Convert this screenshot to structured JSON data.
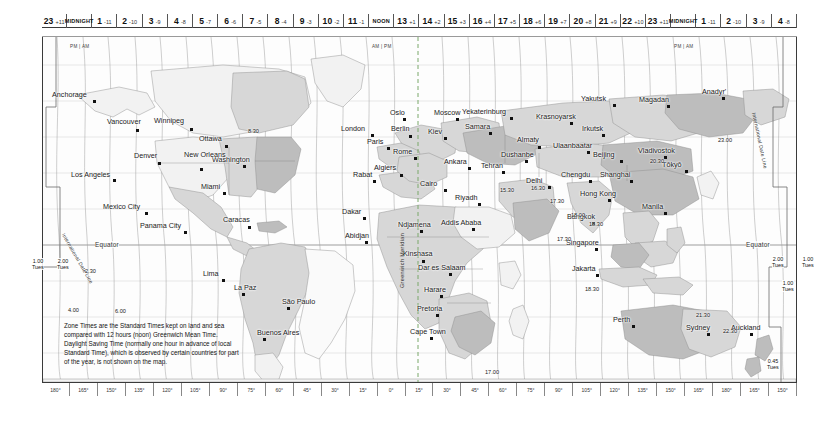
{
  "hour_axis": {
    "label": "Zone standard time across the map",
    "cells": [
      {
        "hour": "23",
        "offset": "+11",
        "sub": ""
      },
      {
        "hour": "MIDNIGHT",
        "offset": "",
        "sub": "PM | AM",
        "midnight": true
      },
      {
        "hour": "1",
        "offset": "-11",
        "sub": ""
      },
      {
        "hour": "2",
        "offset": "-10",
        "sub": ""
      },
      {
        "hour": "3",
        "offset": "-9",
        "sub": ""
      },
      {
        "hour": "4",
        "offset": "-8",
        "sub": ""
      },
      {
        "hour": "5",
        "offset": "-7",
        "sub": ""
      },
      {
        "hour": "6",
        "offset": "-6",
        "sub": ""
      },
      {
        "hour": "7",
        "offset": "-5",
        "sub": ""
      },
      {
        "hour": "8",
        "offset": "-4",
        "sub": ""
      },
      {
        "hour": "9",
        "offset": "-3",
        "sub": ""
      },
      {
        "hour": "10",
        "offset": "-2",
        "sub": ""
      },
      {
        "hour": "11",
        "offset": "-1",
        "sub": ""
      },
      {
        "hour": "NOON",
        "offset": "",
        "sub": "AM | PM",
        "midnight": true
      },
      {
        "hour": "13",
        "offset": "+1",
        "sub": ""
      },
      {
        "hour": "14",
        "offset": "+2",
        "sub": ""
      },
      {
        "hour": "15",
        "offset": "+3",
        "sub": ""
      },
      {
        "hour": "16",
        "offset": "+4",
        "sub": ""
      },
      {
        "hour": "17",
        "offset": "+5",
        "sub": ""
      },
      {
        "hour": "18",
        "offset": "+6",
        "sub": ""
      },
      {
        "hour": "19",
        "offset": "+7",
        "sub": ""
      },
      {
        "hour": "20",
        "offset": "+8",
        "sub": ""
      },
      {
        "hour": "21",
        "offset": "+9",
        "sub": ""
      },
      {
        "hour": "22",
        "offset": "+10",
        "sub": ""
      },
      {
        "hour": "23",
        "offset": "+11",
        "sub": ""
      },
      {
        "hour": "MIDNIGHT",
        "offset": "",
        "sub": "PM | AM",
        "midnight": true
      },
      {
        "hour": "1",
        "offset": "-11",
        "sub": ""
      },
      {
        "hour": "2",
        "offset": "-10",
        "sub": ""
      },
      {
        "hour": "3",
        "offset": "-9",
        "sub": ""
      },
      {
        "hour": "4",
        "offset": "-8",
        "sub": ""
      }
    ]
  },
  "longitude_axis": {
    "labels": [
      "180°",
      "165°",
      "150°",
      "135°",
      "120°",
      "105°",
      "90°",
      "75°",
      "60°",
      "45°",
      "30°",
      "15°",
      "0°",
      "15°",
      "30°",
      "45°",
      "60°",
      "75°",
      "90°",
      "105°",
      "120°",
      "135°",
      "150°",
      "165°",
      "180°",
      "165°",
      "150°"
    ]
  },
  "legend": {
    "text": "Zone Times are the Standard Times kept on land and sea compared with 12 hours (noon) Greenwich Mean Time. Daylight Saving Time (normally one hour in advance of local Standard Time), which is observed by certain countries for part of the year, is not shown on the map."
  },
  "map_labels": {
    "equator_left": "Equator",
    "equator_right": "Equator",
    "greenwich_meridian": "Greenwich Meridian",
    "international_date_line_left": "International Date Line",
    "international_date_line_right": "International Date Line"
  },
  "date_boxes": [
    {
      "time": "1.00",
      "day": "Tues",
      "x": 32,
      "y": 258
    },
    {
      "time": "2.00",
      "day": "Tues",
      "x": 57,
      "y": 258
    },
    {
      "time": "2.00",
      "day": "Tues",
      "x": 772,
      "y": 256
    },
    {
      "time": "1.00",
      "day": "Tues",
      "x": 802,
      "y": 256
    },
    {
      "time": "1.00",
      "day": "Tues",
      "x": 782,
      "y": 280
    },
    {
      "time": "0.45",
      "day": "Tues",
      "x": 767,
      "y": 358
    }
  ],
  "half_hour_offsets": [
    {
      "label": "8.30",
      "x": 248,
      "y": 128
    },
    {
      "label": "2.30",
      "x": 85,
      "y": 268
    },
    {
      "label": "4.00",
      "x": 68,
      "y": 307
    },
    {
      "label": "6.00",
      "x": 115,
      "y": 308
    },
    {
      "label": "15.30",
      "x": 500,
      "y": 187
    },
    {
      "label": "16.30",
      "x": 531,
      "y": 185
    },
    {
      "label": "17.30",
      "x": 550,
      "y": 198
    },
    {
      "label": "17.30",
      "x": 557,
      "y": 236
    },
    {
      "label": "18.00",
      "x": 571,
      "y": 212
    },
    {
      "label": "18.30",
      "x": 589,
      "y": 221
    },
    {
      "label": "18.30",
      "x": 585,
      "y": 286
    },
    {
      "label": "17.00",
      "x": 485,
      "y": 369
    },
    {
      "label": "20.30",
      "x": 650,
      "y": 158
    },
    {
      "label": "21.30",
      "x": 696,
      "y": 312
    },
    {
      "label": "22.30",
      "x": 723,
      "y": 328
    },
    {
      "label": "23.00",
      "x": 718,
      "y": 137
    }
  ],
  "cities": [
    {
      "name": "Anchorage",
      "x": 93,
      "y": 100,
      "dx": 41,
      "dy": 9
    },
    {
      "name": "Vancouver",
      "x": 136,
      "y": 129,
      "dx": 29,
      "dy": 11
    },
    {
      "name": "Winnipeg",
      "x": 190,
      "y": 128,
      "dx": 36,
      "dy": 11
    },
    {
      "name": "Ottawa",
      "x": 225,
      "y": 145,
      "dx": 26,
      "dy": 10
    },
    {
      "name": "Washington",
      "x": 243,
      "y": 165,
      "dx": 31,
      "dy": 9
    },
    {
      "name": "Denver",
      "x": 158,
      "y": 162,
      "dx": 24,
      "dy": 10
    },
    {
      "name": "Los Angeles",
      "x": 113,
      "y": 179,
      "dx": 42,
      "dy": 8
    },
    {
      "name": "New Orleans",
      "x": 200,
      "y": 168,
      "dx": 16,
      "dy": 17
    },
    {
      "name": "Miami",
      "x": 223,
      "y": 192,
      "dx": 22,
      "dy": 9
    },
    {
      "name": "Mexico City",
      "x": 145,
      "y": 212,
      "dx": 42,
      "dy": 9
    },
    {
      "name": "Panama City",
      "x": 184,
      "y": 231,
      "dx": 44,
      "dy": 9
    },
    {
      "name": "Caracas",
      "x": 248,
      "y": 226,
      "dx": 25,
      "dy": 10
    },
    {
      "name": "Lima",
      "x": 222,
      "y": 279,
      "dx": 19,
      "dy": 9
    },
    {
      "name": "La Paz",
      "x": 242,
      "y": 293,
      "dx": 8,
      "dy": 9
    },
    {
      "name": "São Paulo",
      "x": 287,
      "y": 307,
      "dx": 5,
      "dy": 9
    },
    {
      "name": "Buenos Aires",
      "x": 263,
      "y": 338,
      "dx": 6,
      "dy": 9
    },
    {
      "name": "London",
      "x": 371,
      "y": 134,
      "dx": 30,
      "dy": 9
    },
    {
      "name": "Oslo",
      "x": 403,
      "y": 118,
      "dx": 13,
      "dy": 9
    },
    {
      "name": "Berlin",
      "x": 409,
      "y": 135,
      "dx": 18,
      "dy": 10
    },
    {
      "name": "Paris",
      "x": 387,
      "y": 147,
      "dx": 20,
      "dy": 9
    },
    {
      "name": "Rome",
      "x": 414,
      "y": 157,
      "dx": 21,
      "dy": 9
    },
    {
      "name": "Kiev",
      "x": 444,
      "y": 137,
      "dx": 16,
      "dy": 9
    },
    {
      "name": "Moscow",
      "x": 456,
      "y": 118,
      "dx": 22,
      "dy": 9
    },
    {
      "name": "Samara",
      "x": 489,
      "y": 132,
      "dx": 24,
      "dy": 9
    },
    {
      "name": "Yekaterinburg",
      "x": 510,
      "y": 117,
      "dx": 48,
      "dy": 9
    },
    {
      "name": "Ankara",
      "x": 468,
      "y": 167,
      "dx": 24,
      "dy": 9
    },
    {
      "name": "Rabat",
      "x": 373,
      "y": 180,
      "dx": 20,
      "dy": 9
    },
    {
      "name": "Algiers",
      "x": 400,
      "y": 174,
      "dx": 26,
      "dy": 10
    },
    {
      "name": "Cairo",
      "x": 444,
      "y": 189,
      "dx": 24,
      "dy": 9
    },
    {
      "name": "Riyadh",
      "x": 478,
      "y": 203,
      "dx": 23,
      "dy": 9
    },
    {
      "name": "Dakar",
      "x": 363,
      "y": 217,
      "dx": 21,
      "dy": 9
    },
    {
      "name": "Abidjan",
      "x": 365,
      "y": 241,
      "dx": 20,
      "dy": 9
    },
    {
      "name": "Ndjamena",
      "x": 420,
      "y": 230,
      "dx": 22,
      "dy": 9
    },
    {
      "name": "Addis Ababa",
      "x": 472,
      "y": 228,
      "dx": 31,
      "dy": 9
    },
    {
      "name": "Kinshasa",
      "x": 422,
      "y": 260,
      "dx": 19,
      "dy": 10
    },
    {
      "name": "Dar es Salaam",
      "x": 449,
      "y": 273,
      "dx": 31,
      "dy": 9
    },
    {
      "name": "Harare",
      "x": 440,
      "y": 295,
      "dx": 16,
      "dy": 9
    },
    {
      "name": "Pretoria",
      "x": 436,
      "y": 314,
      "dx": 19,
      "dy": 9
    },
    {
      "name": "Cape Town",
      "x": 430,
      "y": 337,
      "dx": 20,
      "dy": 9
    },
    {
      "name": "Dushanbe",
      "x": 525,
      "y": 160,
      "dx": 24,
      "dy": 9
    },
    {
      "name": "Tehran",
      "x": 502,
      "y": 171,
      "dx": 21,
      "dy": 9
    },
    {
      "name": "Almaty",
      "x": 538,
      "y": 146,
      "dx": 21,
      "dy": 10
    },
    {
      "name": "Krasnoyarsk",
      "x": 570,
      "y": 122,
      "dx": 34,
      "dy": 9
    },
    {
      "name": "Yakutsk",
      "x": 613,
      "y": 104,
      "dx": 32,
      "dy": 9
    },
    {
      "name": "Irkutsk",
      "x": 602,
      "y": 134,
      "dx": 20,
      "dy": 9
    },
    {
      "name": "Ulaanbaatar",
      "x": 587,
      "y": 151,
      "dx": 34,
      "dy": 9
    },
    {
      "name": "Magadan",
      "x": 667,
      "y": 105,
      "dx": 28,
      "dy": 9
    },
    {
      "name": "Anadyr'",
      "x": 722,
      "y": 97,
      "dx": 20,
      "dy": 9
    },
    {
      "name": "Vladivostok",
      "x": 664,
      "y": 156,
      "dx": 26,
      "dy": 9
    },
    {
      "name": "Beijing",
      "x": 620,
      "y": 160,
      "dx": 27,
      "dy": 9
    },
    {
      "name": "Tōkyō",
      "x": 685,
      "y": 170,
      "dx": 23,
      "dy": 9
    },
    {
      "name": "Shanghai",
      "x": 630,
      "y": 180,
      "dx": 30,
      "dy": 9
    },
    {
      "name": "Chengdu",
      "x": 589,
      "y": 180,
      "dx": 28,
      "dy": 9
    },
    {
      "name": "Delhi",
      "x": 548,
      "y": 186,
      "dx": 22,
      "dy": 9
    },
    {
      "name": "Hong Kong",
      "x": 608,
      "y": 199,
      "dx": 28,
      "dy": 9
    },
    {
      "name": "Manila",
      "x": 664,
      "y": 212,
      "dx": 22,
      "dy": 9
    },
    {
      "name": "Bangkok",
      "x": 592,
      "y": 222,
      "dx": 25,
      "dy": 9
    },
    {
      "name": "Singapore",
      "x": 595,
      "y": 248,
      "dx": 29,
      "dy": 9
    },
    {
      "name": "Jakarta",
      "x": 596,
      "y": 274,
      "dx": 24,
      "dy": 9
    },
    {
      "name": "Perth",
      "x": 632,
      "y": 325,
      "dx": 19,
      "dy": 9
    },
    {
      "name": "Sydney",
      "x": 707,
      "y": 333,
      "dx": 21,
      "dy": 9
    },
    {
      "name": "Auckland",
      "x": 750,
      "y": 333,
      "dx": 19,
      "dy": 9
    }
  ],
  "colors": {
    "frame": "#3a3a3a",
    "land_light": "#f1f1f1",
    "land_mid": "#d5d5d5",
    "land_dark": "#b9b9b9",
    "ocean": "#fdfdfd",
    "meridian_dash": "#7aa86b",
    "text": "#1a1a1a"
  }
}
